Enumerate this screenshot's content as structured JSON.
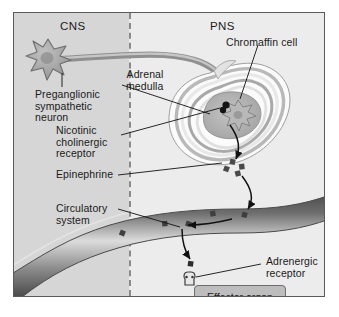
{
  "figure": {
    "regions": [
      {
        "id": "cns",
        "label": "CNS",
        "description": "central nervous system panel, shaded gray"
      },
      {
        "id": "pns",
        "label": "PNS",
        "description": "peripheral nervous system panel, light gray"
      }
    ],
    "divider": "vertical-dashed-line"
  },
  "labels": {
    "cns_header": "CNS",
    "pns_header": "PNS",
    "preganglionic_neuron": "Preganglionic\nsympathetic\nneuron",
    "adrenal_medulla": "Adrenal\nmedulla",
    "chromaffin_cell": "Chromaffin cell",
    "nicotinic_receptor": "Nicotinic\ncholinergic\nreceptor",
    "epinephrine": "Epinephrine",
    "circulatory_system": "Circulatory\nsystem",
    "adrenergic_receptor": "Adrenergic\nreceptor",
    "effector_organ": "Effector organ"
  },
  "structures": {
    "neuron": "star-shaped-soma-with-axon",
    "adrenal_gland": "concentric-banded-gland",
    "chromaffin": "star-shaped-cell",
    "blood_vessel": "diagonal-gradient-band",
    "receptor_glyph": "adrenergic-receptor-shape",
    "epinephrine_marker": "small-dark-square"
  },
  "colors": {
    "cns_panel": "#d6d6d6",
    "pns_panel": "#ececec",
    "frame_border": "#5a5a5a",
    "divider": "#8a8a8a",
    "text": "#1a1a1a",
    "neuron_fill": "#a8a8a8",
    "neuron_stroke": "#6e6e6e",
    "axon": "#b0b0b0",
    "gland_light": "#f2f2f2",
    "gland_mid": "#c9c9c9",
    "gland_dark": "#9a9a9a",
    "medulla": "#b5b5b5",
    "vessel_dark": "#5c5c5c",
    "vessel_light": "#d8d8d8",
    "epinephrine": "#4a4a4a",
    "arrow": "#111111",
    "leader_line": "#111111",
    "effector_fill": "#bdbdbd",
    "effector_border": "#6e6e6e"
  },
  "counts": {
    "epinephrine_released": 4,
    "epinephrine_in_vessel": 5,
    "epinephrine_at_receptor": 1
  }
}
